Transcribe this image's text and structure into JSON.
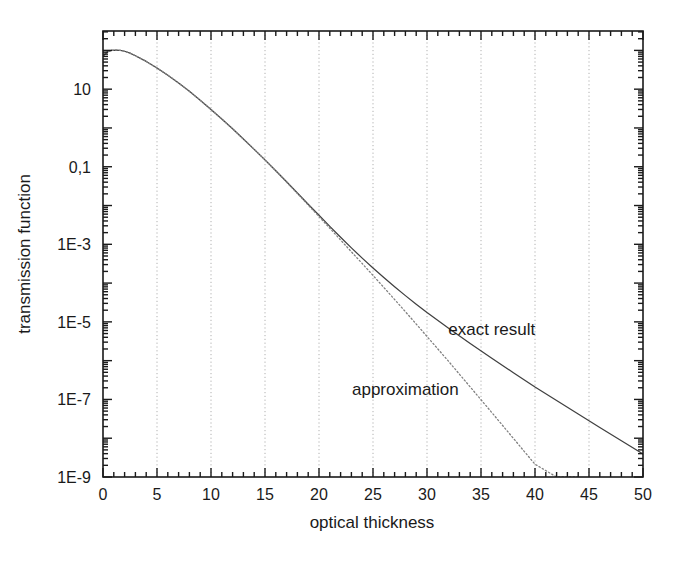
{
  "chart_data": {
    "type": "line",
    "title": "",
    "xlabel": "optical thickness",
    "ylabel": "transmission function",
    "xlim": [
      0,
      50
    ],
    "ylim": [
      1e-09,
      316.227766
    ],
    "yscale": "log",
    "xscale": "linear",
    "grid": "vertical-dotted-at-major-x",
    "legend_position": "inline-annotations",
    "x_ticks_major": [
      0,
      5,
      10,
      15,
      20,
      25,
      30,
      35,
      40,
      45,
      50
    ],
    "x_tick_labels": [
      "0",
      "5",
      "10",
      "15",
      "20",
      "25",
      "30",
      "35",
      "40",
      "45",
      "50"
    ],
    "x_minor_step": 1,
    "y_ticks_major": [
      10,
      0.1,
      0.001,
      1e-05,
      1e-07,
      1e-09
    ],
    "y_tick_labels": [
      "10",
      "0,1",
      "1E-3",
      "1E-5",
      "1E-7",
      "1E-9"
    ],
    "y_decade_minor": [
      2,
      3,
      4,
      5,
      6,
      7,
      8,
      9
    ],
    "series": [
      {
        "name": "exact result",
        "style": "solid",
        "color": "#404040",
        "annotation": "exact result",
        "x": [
          0,
          0.4,
          0.8,
          1.2,
          1.6,
          2.0,
          2.5,
          3,
          4,
          5,
          6,
          7,
          8,
          9,
          10,
          11,
          12,
          13,
          14,
          15,
          16,
          17,
          18,
          19,
          20,
          21,
          22,
          23,
          24,
          25,
          26,
          27,
          28,
          29,
          30,
          32,
          34,
          36,
          38,
          40,
          42,
          44,
          46,
          48,
          50
        ],
        "y": [
          70,
          92,
          100,
          102,
          100,
          95,
          85,
          73,
          52,
          35,
          23,
          14.5,
          8.8,
          5.2,
          3.0,
          1.7,
          0.95,
          0.52,
          0.28,
          0.15,
          0.079,
          0.041,
          0.021,
          0.0108,
          0.0056,
          0.0029,
          0.00152,
          0.00081,
          0.00044,
          0.000245,
          0.000139,
          8.05e-05,
          4.75e-05,
          2.85e-05,
          1.74e-05,
          6.8e-06,
          2.75e-06,
          1.15e-06,
          4.9e-07,
          2.1e-07,
          9.4e-08,
          4.2e-08,
          1.9e-08,
          8.6e-09,
          3.9e-09
        ]
      },
      {
        "name": "approximation",
        "style": "dotted",
        "color": "#808080",
        "annotation": "approximation",
        "x": [
          0,
          0.4,
          0.8,
          1.2,
          1.6,
          2.0,
          2.5,
          3,
          4,
          5,
          6,
          7,
          8,
          9,
          10,
          11,
          12,
          13,
          14,
          15,
          16,
          17,
          18,
          19,
          20,
          21,
          22,
          23,
          24,
          25,
          26,
          27,
          28,
          29,
          30,
          32,
          34,
          36,
          38,
          40,
          42,
          44,
          46,
          47,
          48,
          48.6
        ],
        "y": [
          70,
          92,
          100,
          102,
          100,
          95,
          85,
          73,
          52,
          35,
          23,
          14.5,
          8.8,
          5.2,
          3.0,
          1.7,
          0.95,
          0.52,
          0.28,
          0.15,
          0.078,
          0.04,
          0.0205,
          0.0103,
          0.0052,
          0.0026,
          0.00129,
          0.00064,
          0.00032,
          0.000158,
          7.75e-05,
          3.78e-05,
          1.83e-05,
          8.8e-06,
          4.2e-06,
          9.6e-07,
          2.1e-07,
          4.6e-08,
          9.9e-09,
          2.13e-09,
          4.6e-10,
          9.9e-11,
          2.15e-11,
          1e-11,
          4.6e-12,
          2.8e-12
        ]
      }
    ],
    "annotations": [
      {
        "text": "exact result",
        "x_data": 36.0,
        "y_data": 4.7e-06
      },
      {
        "text": "approximation",
        "x_data": 28.0,
        "y_data": 1.3e-07
      }
    ]
  },
  "colors": {
    "frame": "#1a1a1a",
    "grid": "#b0b0b0",
    "exact_curve": "#404040",
    "approx_curve": "#888888",
    "text": "#1a1a1a",
    "background": "#ffffff"
  }
}
